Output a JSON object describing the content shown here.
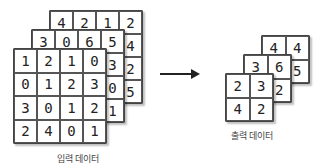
{
  "input": {
    "label": "입력 데이터",
    "channels": [
      [
        [
          "4",
          "2",
          "1",
          "2"
        ],
        [
          "",
          "",
          "",
          "4"
        ],
        [
          "",
          "",
          "",
          "2"
        ],
        [
          "",
          "",
          "",
          "5"
        ]
      ],
      [
        [
          "3",
          "0",
          "6",
          "5"
        ],
        [
          "",
          "",
          "",
          "3"
        ],
        [
          "",
          "",
          "",
          "0"
        ],
        [
          "",
          "",
          "",
          "1"
        ]
      ],
      [
        [
          "1",
          "2",
          "1",
          "0"
        ],
        [
          "0",
          "1",
          "2",
          "3"
        ],
        [
          "3",
          "0",
          "1",
          "2"
        ],
        [
          "2",
          "4",
          "0",
          "1"
        ]
      ]
    ]
  },
  "output": {
    "label": "출력 데이터",
    "channels": [
      [
        [
          "4",
          "4"
        ],
        [
          "",
          "5"
        ]
      ],
      [
        [
          "3",
          "6"
        ],
        [
          "",
          "2"
        ]
      ],
      [
        [
          "2",
          "3"
        ],
        [
          "4",
          "2"
        ]
      ]
    ]
  }
}
